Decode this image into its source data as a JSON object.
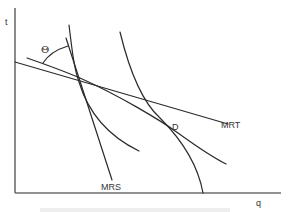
{
  "diagram": {
    "axes": {
      "y_label": "t",
      "x_label": "q"
    },
    "labels": {
      "theta": "Θ",
      "mrt": "MRT",
      "mrs": "MRS",
      "point_d": "D"
    },
    "elements": [
      {
        "id": "mrt-line",
        "type": "straight line",
        "label": "MRT"
      },
      {
        "id": "mrs-line",
        "type": "straight line",
        "label": "MRS"
      },
      {
        "id": "steep-indifference-curve",
        "type": "convex curve"
      },
      {
        "id": "flat-indifference-curve",
        "type": "convex curve",
        "tangent_at": "D"
      },
      {
        "id": "transformation-curve",
        "type": "concave curve",
        "passes_through": "D"
      },
      {
        "id": "theta-angle-arc",
        "type": "arc",
        "label": "Θ"
      }
    ],
    "caption": "Figure caption (cut off)"
  }
}
